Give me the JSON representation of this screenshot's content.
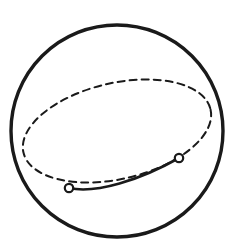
{
  "figure": {
    "title": "Sphere with great-circle path",
    "background_color": "#ffffff",
    "stroke_color": "#1a1a1a",
    "marker_fill_color": "#ffffff"
  },
  "chart_data": {
    "type": "diagram",
    "title": "Sphere with great-circle path",
    "canvas": {
      "width": 235,
      "height": 252
    },
    "shapes": [
      {
        "name": "sphere-outline",
        "kind": "circle",
        "cx": 117,
        "cy": 131,
        "r": 106,
        "stroke": "#1a1a1a",
        "stroke_width": 3.4,
        "fill": "none",
        "dashed": false
      },
      {
        "name": "great-circle-ellipse",
        "kind": "ellipse",
        "cx": 117,
        "cy": 131,
        "rx": 96,
        "ry": 48,
        "rotation_deg": -13,
        "stroke": "#1a1a1a",
        "stroke_width": 2.0,
        "fill": "none",
        "dashed": true,
        "dash_pattern": "7 5"
      },
      {
        "name": "visible-geodesic-arc",
        "kind": "path",
        "path": "M 69 188 C 96 194 140 180 179 158",
        "stroke": "#1a1a1a",
        "stroke_width": 2.6,
        "fill": "none",
        "dashed": false
      }
    ],
    "markers": [
      {
        "name": "waypoint-start",
        "x": 69,
        "y": 188,
        "r": 4.2,
        "fill": "#ffffff",
        "stroke": "#1a1a1a",
        "stroke_width": 2.2
      },
      {
        "name": "waypoint-end",
        "x": 179,
        "y": 158,
        "r": 4.2,
        "fill": "#ffffff",
        "stroke": "#1a1a1a",
        "stroke_width": 2.2
      }
    ],
    "labels": [],
    "legend": [],
    "grid": false
  }
}
